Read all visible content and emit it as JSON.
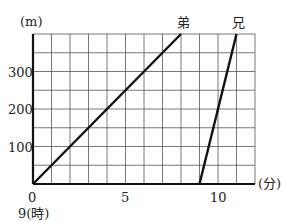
{
  "chart_data": {
    "type": "line",
    "title": "",
    "xlabel": "(分)",
    "ylabel": "(m)",
    "x_origin_label": "9(時)",
    "xlim": [
      0,
      12
    ],
    "ylim": [
      0,
      400
    ],
    "x_ticks": [
      0,
      5,
      10
    ],
    "y_ticks": [
      100,
      200,
      300
    ],
    "grid": true,
    "grid_x_step": 1,
    "grid_y_step": 50,
    "series": [
      {
        "name": "弟",
        "points": [
          [
            0,
            0
          ],
          [
            8,
            400
          ]
        ]
      },
      {
        "name": "兄",
        "points": [
          [
            9,
            0
          ],
          [
            11,
            400
          ]
        ]
      }
    ]
  },
  "labels": {
    "y_unit": "(m)",
    "x_unit": "(分)",
    "origin": "0",
    "origin_time": "9(時)",
    "x5": "5",
    "x10": "10",
    "y100": "100",
    "y200": "200",
    "y300": "300",
    "series_younger": "弟",
    "series_older": "兄"
  }
}
